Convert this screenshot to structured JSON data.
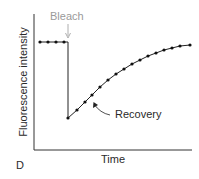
{
  "panel_label": "D",
  "chart_data": {
    "type": "line",
    "title": "",
    "xlabel": "Time",
    "ylabel": "Fluorescence intensity",
    "annotations": [
      {
        "text": "Bleach",
        "color": "#9a9a9a",
        "arrow_to": "drop"
      },
      {
        "text": "Recovery",
        "color": "#2a2a2a",
        "arrow_to": "recovery curve"
      }
    ],
    "grid": false,
    "legend": null,
    "series": [
      {
        "name": "FRAP",
        "points_px": [
          [
            40,
            42
          ],
          [
            48,
            42
          ],
          [
            56,
            42
          ],
          [
            64,
            42
          ],
          [
            68,
            118
          ],
          [
            77,
            110
          ],
          [
            85,
            102
          ],
          [
            92,
            95
          ],
          [
            100,
            87
          ],
          [
            108,
            80
          ],
          [
            116,
            74
          ],
          [
            124,
            69
          ],
          [
            132,
            64
          ],
          [
            140,
            60
          ],
          [
            148,
            56
          ],
          [
            156,
            53
          ],
          [
            164,
            50
          ],
          [
            172,
            48
          ],
          [
            180,
            46
          ],
          [
            190,
            45
          ]
        ],
        "normalized_values": {
          "pre_bleach": 1.0,
          "post_bleach": 0.25,
          "recovery_plateau": 0.98
        }
      }
    ]
  }
}
